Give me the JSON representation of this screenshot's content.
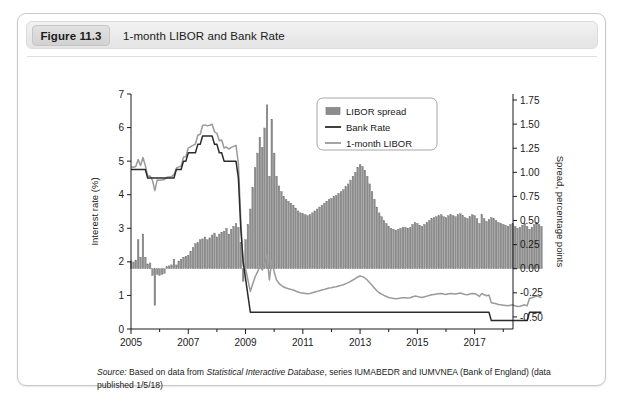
{
  "figure": {
    "badge": "Figure 11.3",
    "title": "1-month LIBOR and Bank Rate",
    "source_prefix": "Source:",
    "source_text_1": " Based on data from ",
    "source_italic": "Statistical Interactive Database",
    "source_text_2": ", series IUMABEDR and IUMVNEA (Bank of England) (data published 1/5/18)"
  },
  "colors": {
    "bar_fill": "#8d8d8d",
    "bar_edge": "#6f6f6f",
    "bank_rate_line": "#2b2b2b",
    "libor_line": "#9a9a9a",
    "axis": "#1a1a1a",
    "card_border": "#c9c9c9",
    "title_bar": "#ebebeb"
  },
  "legend": {
    "position": "top-right",
    "items": [
      {
        "label": "LIBOR spread",
        "marker": "bar-swatch"
      },
      {
        "label": "Bank Rate",
        "marker": "line-dark"
      },
      {
        "label": "1-month LIBOR",
        "marker": "line-light"
      }
    ]
  },
  "chart_data": {
    "type": "bar",
    "title": "1-month LIBOR and Bank Rate",
    "xlabel": "",
    "ylabel": "Interest rate (%)",
    "y2label": "Spread, percentage points",
    "ylim": [
      0,
      7
    ],
    "y2lim": [
      -0.625,
      1.8125
    ],
    "yticks": [
      0,
      1,
      2,
      3,
      4,
      5,
      6,
      7
    ],
    "ytick_labels": [
      "0",
      "1",
      "2",
      "3",
      "4",
      "5",
      "6",
      "7"
    ],
    "y2ticks": [
      -0.5,
      -0.25,
      0.0,
      0.25,
      0.5,
      0.75,
      1.0,
      1.25,
      1.5,
      1.75
    ],
    "y2tick_labels": [
      "-0.50",
      "-0.25",
      "0.00",
      "0.25",
      "0.50",
      "0.75",
      "1.00",
      "1.25",
      "1.50",
      "1.75"
    ],
    "xlim": [
      2005.0,
      2018.34
    ],
    "xticks": [
      2005,
      2007,
      2009,
      2011,
      2013,
      2015,
      2017
    ],
    "xtick_labels": [
      "2005",
      "2007",
      "2009",
      "2011",
      "2013",
      "2015",
      "2017"
    ],
    "xminorticks": [
      2006,
      2008,
      2010,
      2012,
      2014,
      2016,
      2018
    ],
    "grid": false,
    "legend_position": "upper right",
    "x_start": 2005.0,
    "x_step": 0.0833333,
    "series": [
      {
        "name": "LIBOR spread",
        "type": "bar",
        "axis": "right",
        "unit": "percentage points",
        "values": [
          0.08,
          0.07,
          0.09,
          0.3,
          0.12,
          0.36,
          0.12,
          0.05,
          0.06,
          -0.07,
          -0.38,
          -0.06,
          -0.07,
          -0.06,
          -0.05,
          0.02,
          0.03,
          0.04,
          0.1,
          0.04,
          0.08,
          0.1,
          0.12,
          0.13,
          0.14,
          0.18,
          0.22,
          0.26,
          0.27,
          0.3,
          0.31,
          0.33,
          0.3,
          0.32,
          0.35,
          0.37,
          0.33,
          0.36,
          0.38,
          0.39,
          0.42,
          0.36,
          0.41,
          0.44,
          0.47,
          0.43,
          0.27,
          -0.13,
          0.3,
          0.46,
          0.62,
          0.84,
          1.05,
          1.2,
          1.36,
          1.26,
          1.46,
          1.7,
          0.96,
          1.55,
          1.2,
          0.96,
          0.86,
          0.8,
          0.75,
          0.72,
          0.7,
          0.68,
          0.66,
          0.63,
          0.6,
          0.58,
          0.57,
          0.56,
          0.55,
          0.56,
          0.58,
          0.6,
          0.62,
          0.64,
          0.66,
          0.68,
          0.7,
          0.72,
          0.73,
          0.75,
          0.76,
          0.78,
          0.8,
          0.82,
          0.85,
          0.88,
          0.92,
          0.96,
          1.0,
          1.05,
          1.08,
          1.06,
          1.02,
          0.96,
          0.88,
          0.8,
          0.72,
          0.64,
          0.58,
          0.54,
          0.5,
          0.47,
          0.44,
          0.42,
          0.41,
          0.4,
          0.41,
          0.42,
          0.43,
          0.43,
          0.42,
          0.43,
          0.46,
          0.48,
          0.47,
          0.45,
          0.44,
          0.46,
          0.48,
          0.5,
          0.52,
          0.53,
          0.54,
          0.55,
          0.56,
          0.54,
          0.53,
          0.55,
          0.56,
          0.55,
          0.54,
          0.56,
          0.57,
          0.55,
          0.53,
          0.52,
          0.54,
          0.56,
          0.55,
          0.52,
          0.47,
          0.56,
          0.52,
          0.49,
          0.51,
          0.53,
          0.52,
          0.5,
          0.48,
          0.47,
          0.46,
          0.45,
          0.44,
          0.46,
          0.47,
          0.44,
          0.42,
          0.43,
          0.45,
          0.47,
          0.44,
          0.41,
          0.43,
          0.46,
          0.48,
          0.46,
          0.44
        ]
      },
      {
        "name": "Bank Rate",
        "type": "line",
        "axis": "left",
        "unit": "%",
        "values": [
          4.75,
          4.75,
          4.75,
          4.75,
          4.75,
          4.75,
          4.75,
          4.5,
          4.5,
          4.5,
          4.5,
          4.5,
          4.5,
          4.5,
          4.5,
          4.5,
          4.5,
          4.5,
          4.5,
          4.75,
          4.75,
          4.75,
          5.0,
          5.0,
          5.25,
          5.25,
          5.25,
          5.25,
          5.5,
          5.5,
          5.75,
          5.75,
          5.75,
          5.75,
          5.75,
          5.5,
          5.5,
          5.25,
          5.25,
          5.0,
          5.0,
          5.0,
          5.0,
          5.0,
          5.0,
          4.5,
          3.0,
          2.0,
          1.5,
          1.0,
          0.5,
          0.5,
          0.5,
          0.5,
          0.5,
          0.5,
          0.5,
          0.5,
          0.5,
          0.5,
          0.5,
          0.5,
          0.5,
          0.5,
          0.5,
          0.5,
          0.5,
          0.5,
          0.5,
          0.5,
          0.5,
          0.5,
          0.5,
          0.5,
          0.5,
          0.5,
          0.5,
          0.5,
          0.5,
          0.5,
          0.5,
          0.5,
          0.5,
          0.5,
          0.5,
          0.5,
          0.5,
          0.5,
          0.5,
          0.5,
          0.5,
          0.5,
          0.5,
          0.5,
          0.5,
          0.5,
          0.5,
          0.5,
          0.5,
          0.5,
          0.5,
          0.5,
          0.5,
          0.5,
          0.5,
          0.5,
          0.5,
          0.5,
          0.5,
          0.5,
          0.5,
          0.5,
          0.5,
          0.5,
          0.5,
          0.5,
          0.5,
          0.5,
          0.5,
          0.5,
          0.5,
          0.5,
          0.5,
          0.5,
          0.5,
          0.5,
          0.5,
          0.5,
          0.5,
          0.5,
          0.5,
          0.5,
          0.5,
          0.5,
          0.5,
          0.5,
          0.5,
          0.5,
          0.5,
          0.5,
          0.5,
          0.5,
          0.5,
          0.5,
          0.5,
          0.5,
          0.5,
          0.5,
          0.5,
          0.5,
          0.5,
          0.25,
          0.25,
          0.25,
          0.25,
          0.25,
          0.25,
          0.25,
          0.25,
          0.25,
          0.25,
          0.25,
          0.25,
          0.25,
          0.25,
          0.25,
          0.25,
          0.5,
          0.5,
          0.5,
          0.5,
          0.5,
          0.5
        ]
      },
      {
        "name": "1-month LIBOR",
        "type": "line",
        "axis": "left",
        "unit": "%",
        "values": [
          4.83,
          4.82,
          4.84,
          5.05,
          4.87,
          5.11,
          4.87,
          4.55,
          4.56,
          4.43,
          4.12,
          4.44,
          4.43,
          4.44,
          4.45,
          4.52,
          4.53,
          4.54,
          4.6,
          4.79,
          4.83,
          4.85,
          5.12,
          5.13,
          5.39,
          5.43,
          5.47,
          5.51,
          5.77,
          5.8,
          6.06,
          6.08,
          6.05,
          6.07,
          6.1,
          5.87,
          5.83,
          5.61,
          5.63,
          5.39,
          5.42,
          5.36,
          5.41,
          5.44,
          5.47,
          4.93,
          3.27,
          1.87,
          1.8,
          1.46,
          1.12,
          1.34,
          1.55,
          1.7,
          1.86,
          1.76,
          1.96,
          2.2,
          1.46,
          2.05,
          1.7,
          1.46,
          1.36,
          1.3,
          1.25,
          1.22,
          1.2,
          1.18,
          1.16,
          1.13,
          1.1,
          1.08,
          1.07,
          1.06,
          1.05,
          1.06,
          1.08,
          1.1,
          1.12,
          1.14,
          1.16,
          1.18,
          1.2,
          1.22,
          1.23,
          1.25,
          1.26,
          1.28,
          1.3,
          1.32,
          1.35,
          1.38,
          1.42,
          1.46,
          1.5,
          1.55,
          1.58,
          1.56,
          1.52,
          1.46,
          1.38,
          1.3,
          1.22,
          1.14,
          1.08,
          1.04,
          1.0,
          0.97,
          0.94,
          0.92,
          0.91,
          0.9,
          0.91,
          0.92,
          0.93,
          0.93,
          0.92,
          0.93,
          0.96,
          0.98,
          0.97,
          0.95,
          0.94,
          0.96,
          0.98,
          1.0,
          1.02,
          1.03,
          1.04,
          1.05,
          1.06,
          1.04,
          1.03,
          1.05,
          1.06,
          1.05,
          1.04,
          1.06,
          1.07,
          1.05,
          1.03,
          1.02,
          1.04,
          1.06,
          1.05,
          1.02,
          0.97,
          1.06,
          1.02,
          0.99,
          1.01,
          0.78,
          0.77,
          0.75,
          0.73,
          0.72,
          0.71,
          0.7,
          0.69,
          0.71,
          0.72,
          0.69,
          0.67,
          0.68,
          0.7,
          0.72,
          0.69,
          0.91,
          0.93,
          0.96,
          0.98,
          0.96,
          0.94
        ]
      }
    ]
  }
}
